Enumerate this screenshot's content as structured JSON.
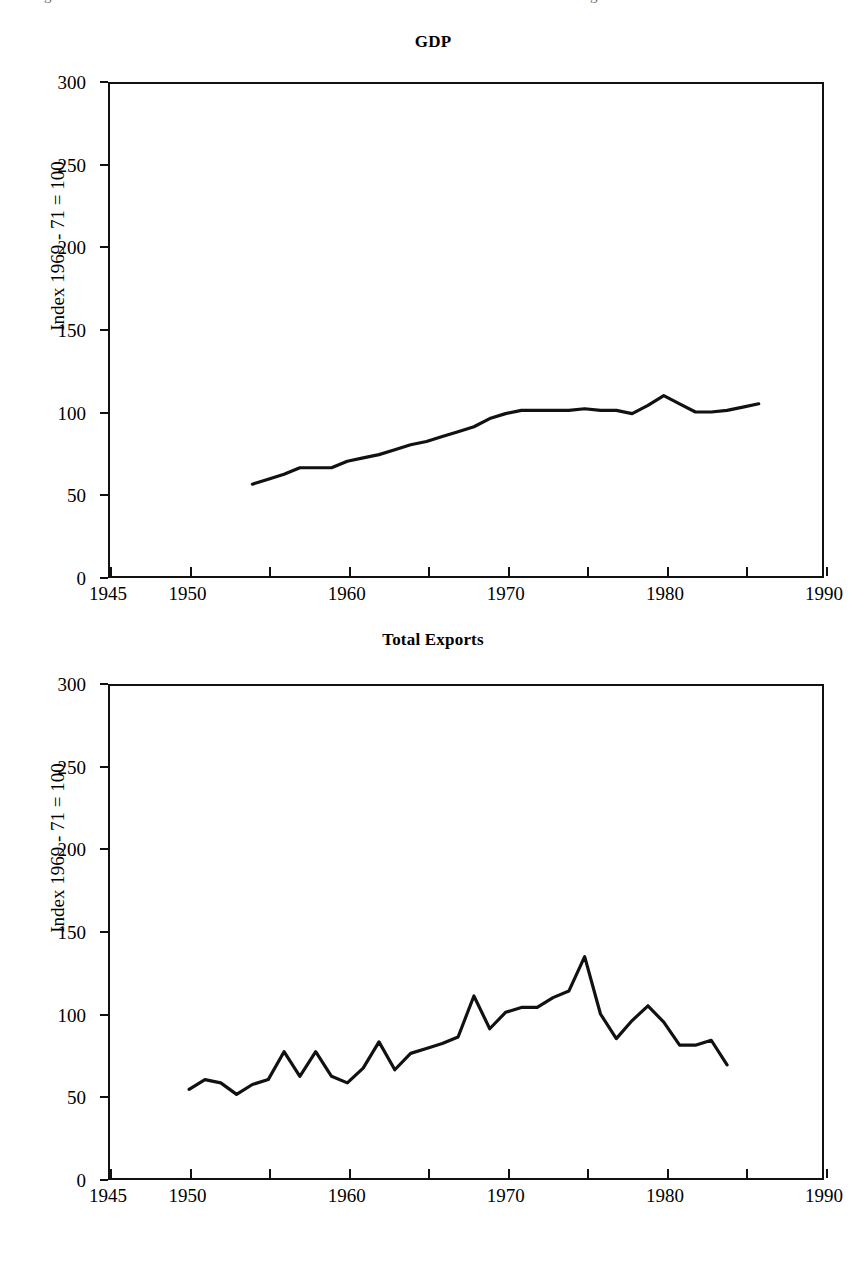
{
  "page": {
    "cutoff_line_left": "g",
    "cutoff_line_right": "g"
  },
  "figures": [
    {
      "id": "gdp",
      "title": "GDP",
      "y_axis_title": "Index 1969 - 71 = 100",
      "y_ticks": [
        "0",
        "50",
        "100",
        "150",
        "200",
        "250",
        "300"
      ],
      "x_ticks": [
        "1945",
        "1950",
        "1960",
        "1970",
        "1980",
        "1990"
      ]
    },
    {
      "id": "exports",
      "title": "Total Exports",
      "y_axis_title": "Index 1969 - 71 = 100",
      "y_ticks": [
        "0",
        "50",
        "100",
        "150",
        "200",
        "250",
        "300"
      ],
      "x_ticks": [
        "1945",
        "1950",
        "1960",
        "1970",
        "1980",
        "1990"
      ]
    }
  ],
  "chart_data": [
    {
      "type": "line",
      "id": "gdp",
      "title": "GDP",
      "xlabel": "",
      "ylabel": "Index 1969 - 71 = 100",
      "xlim": [
        1945,
        1990
      ],
      "ylim": [
        0,
        300
      ],
      "x_tick_values": [
        1945,
        1950,
        1955,
        1960,
        1965,
        1970,
        1975,
        1980,
        1985,
        1990
      ],
      "x_tick_labels_shown": [
        1945,
        1950,
        1960,
        1970,
        1980,
        1990
      ],
      "y_tick_values": [
        0,
        50,
        100,
        150,
        200,
        250,
        300
      ],
      "grid": false,
      "legend": "none",
      "series": [
        {
          "name": "GDP index",
          "x": [
            1954,
            1955,
            1956,
            1957,
            1958,
            1959,
            1960,
            1961,
            1962,
            1963,
            1964,
            1965,
            1966,
            1967,
            1968,
            1969,
            1970,
            1971,
            1972,
            1973,
            1974,
            1975,
            1976,
            1977,
            1978,
            1979,
            1980,
            1981,
            1982,
            1983,
            1984,
            1985,
            1986
          ],
          "y": [
            56,
            59,
            62,
            66,
            66,
            66,
            70,
            72,
            74,
            77,
            80,
            82,
            85,
            88,
            91,
            96,
            99,
            101,
            101,
            101,
            101,
            102,
            101,
            101,
            99,
            104,
            110,
            105,
            100,
            100,
            101,
            103,
            105
          ]
        }
      ]
    },
    {
      "type": "line",
      "id": "exports",
      "title": "Total Exports",
      "xlabel": "",
      "ylabel": "Index 1969 - 71 = 100",
      "xlim": [
        1945,
        1990
      ],
      "ylim": [
        0,
        300
      ],
      "x_tick_values": [
        1945,
        1950,
        1955,
        1960,
        1965,
        1970,
        1975,
        1980,
        1985,
        1990
      ],
      "x_tick_labels_shown": [
        1945,
        1950,
        1960,
        1970,
        1980,
        1990
      ],
      "y_tick_values": [
        0,
        50,
        100,
        150,
        200,
        250,
        300
      ],
      "grid": false,
      "legend": "none",
      "series": [
        {
          "name": "Total exports index",
          "x": [
            1950,
            1951,
            1952,
            1953,
            1954,
            1955,
            1956,
            1957,
            1958,
            1959,
            1960,
            1961,
            1962,
            1963,
            1964,
            1965,
            1966,
            1967,
            1968,
            1969,
            1970,
            1971,
            1972,
            1973,
            1974,
            1975,
            1976,
            1977,
            1978,
            1979,
            1980,
            1981,
            1982,
            1983,
            1984
          ],
          "y": [
            54,
            60,
            58,
            51,
            57,
            60,
            77,
            62,
            77,
            62,
            58,
            67,
            83,
            66,
            76,
            79,
            82,
            86,
            111,
            91,
            101,
            104,
            104,
            110,
            114,
            135,
            100,
            85,
            96,
            105,
            95,
            81,
            81,
            84,
            69,
            80
          ]
        }
      ]
    }
  ]
}
